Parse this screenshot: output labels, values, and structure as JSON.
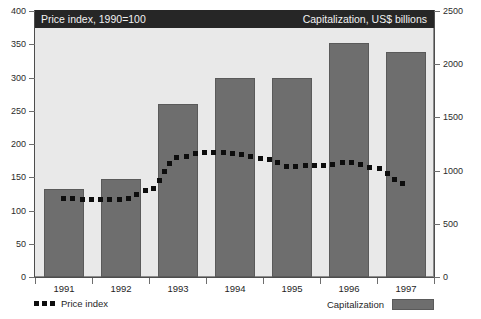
{
  "page": {
    "clipped_caption": ""
  },
  "header": {
    "left_title": "Price index, 1990=100",
    "right_title": "Capitalization, US$ billions"
  },
  "legend": {
    "price_index_label": "Price index",
    "capitalization_label": "Capitalization"
  },
  "colors": {
    "bar_fill": "#6e6e6e",
    "line_dots": "#0d0d0d",
    "header_band": "#262626",
    "plot_background": "#e9e9e9"
  },
  "chart_data": {
    "type": "bar",
    "title": "",
    "xlabel": "",
    "categories": [
      "1991",
      "1992",
      "1993",
      "1994",
      "1995",
      "1996",
      "1997"
    ],
    "grid": false,
    "legend_position": "bottom",
    "axes": {
      "left": {
        "label": "Price index, 1990=100",
        "ylim": [
          0,
          400
        ],
        "ticks": [
          0,
          50,
          100,
          150,
          200,
          250,
          300,
          350,
          400
        ]
      },
      "right": {
        "label": "Capitalization, US$ billions",
        "ylim": [
          0,
          2500
        ],
        "ticks": [
          0,
          500,
          1000,
          1500,
          2000,
          2500
        ]
      }
    },
    "series": [
      {
        "name": "Capitalization",
        "type": "bar",
        "axis": "right",
        "unit": "US$ billions",
        "values": [
          825,
          920,
          1625,
          1875,
          1875,
          2200,
          2110
        ]
      },
      {
        "name": "Price index",
        "type": "line",
        "style": "dotted",
        "axis": "left",
        "unit": "1990=100",
        "values": [
          118,
          116,
          185,
          186,
          166,
          172,
          140
        ],
        "points": [
          {
            "x": 1991.0,
            "y": 118
          },
          {
            "x": 1991.5,
            "y": 116
          },
          {
            "x": 1992.0,
            "y": 116
          },
          {
            "x": 1992.5,
            "y": 130
          },
          {
            "x": 1993.0,
            "y": 180
          },
          {
            "x": 1993.5,
            "y": 188
          },
          {
            "x": 1994.0,
            "y": 186
          },
          {
            "x": 1994.5,
            "y": 178
          },
          {
            "x": 1995.0,
            "y": 166
          },
          {
            "x": 1995.5,
            "y": 168
          },
          {
            "x": 1996.0,
            "y": 172
          },
          {
            "x": 1996.5,
            "y": 163
          },
          {
            "x": 1997.0,
            "y": 140
          }
        ]
      }
    ]
  }
}
